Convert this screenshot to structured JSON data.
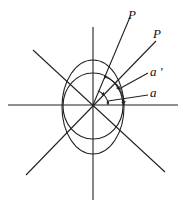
{
  "diagram": {
    "labels": {
      "p1": "P",
      "p2": "P",
      "a_prime": "a '",
      "a": "a"
    },
    "colors": {
      "stroke": "#222222",
      "background": "#ffffff"
    }
  }
}
